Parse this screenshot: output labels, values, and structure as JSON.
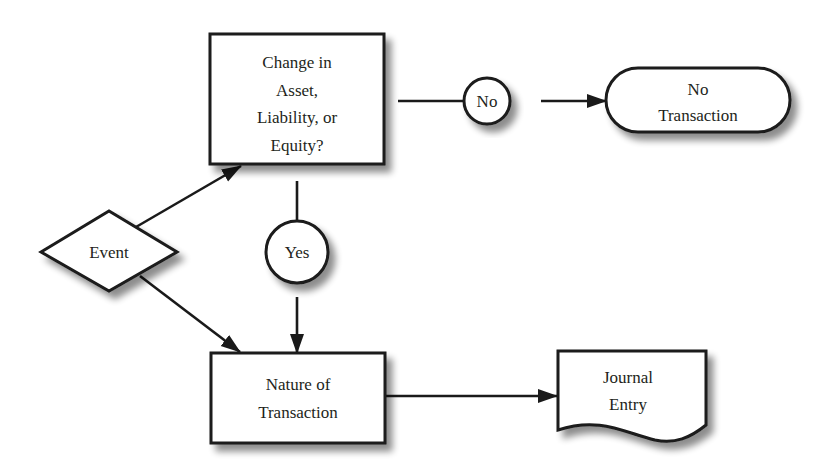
{
  "diagram": {
    "type": "flowchart",
    "nodes": {
      "event": {
        "shape": "diamond",
        "lines": [
          "Event"
        ]
      },
      "change_question": {
        "shape": "rectangle",
        "lines": [
          "Change in",
          "Asset,",
          "Liability, or",
          "Equity?"
        ]
      },
      "no_connector": {
        "shape": "circle",
        "lines": [
          "No"
        ]
      },
      "no_transaction": {
        "shape": "terminal",
        "lines": [
          "No",
          "Transaction"
        ]
      },
      "yes_connector": {
        "shape": "circle",
        "lines": [
          "Yes"
        ]
      },
      "nature_of_transaction": {
        "shape": "rectangle",
        "lines": [
          "Nature of",
          "Transaction"
        ]
      },
      "journal_entry": {
        "shape": "document",
        "lines": [
          "Journal",
          "Entry"
        ]
      }
    },
    "edges": [
      {
        "from": "event",
        "to": "change_question",
        "arrow": true
      },
      {
        "from": "event",
        "to": "nature_of_transaction",
        "arrow": true
      },
      {
        "from": "change_question",
        "to": "no_connector",
        "arrow": false
      },
      {
        "from": "no_connector",
        "to": "no_transaction",
        "arrow": true
      },
      {
        "from": "change_question",
        "to": "yes_connector",
        "arrow": false
      },
      {
        "from": "yes_connector",
        "to": "nature_of_transaction",
        "arrow": true
      },
      {
        "from": "nature_of_transaction",
        "to": "journal_entry",
        "arrow": true
      }
    ],
    "colors": {
      "stroke": "#1a1a1a",
      "fill": "#ffffff",
      "text": "#231f20",
      "shadow": "#9a9a9a",
      "background": "#ffffff"
    }
  }
}
